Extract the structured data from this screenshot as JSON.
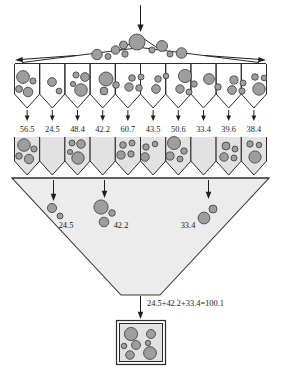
{
  "diagram": {
    "top_feed": {
      "icon": "down-arrow-icon"
    },
    "spread_arrows": {
      "left": "left-arrow-icon",
      "right": "right-arrow-icon"
    },
    "weights_row": {
      "label": "hopper-weights",
      "values": [
        "56.5",
        "24.5",
        "48.4",
        "42.2",
        "60.7",
        "43.5",
        "50.6",
        "33.4",
        "39.6",
        "38.4"
      ]
    },
    "selected_in_funnel": [
      {
        "value": "24.5",
        "from_hopper": 2
      },
      {
        "value": "42.2",
        "from_hopper": 4
      },
      {
        "value": "33.4",
        "from_hopper": 8
      }
    ],
    "total_equation": "24.5+42.2+33.4=100.1",
    "colors": {
      "ball_fill": "#9e9e9e",
      "ball_stroke": "#3a3a3a",
      "funnel_fill": "#ececec",
      "hopper_fill": "#e2e2e2",
      "line": "#2b2b2b"
    }
  }
}
